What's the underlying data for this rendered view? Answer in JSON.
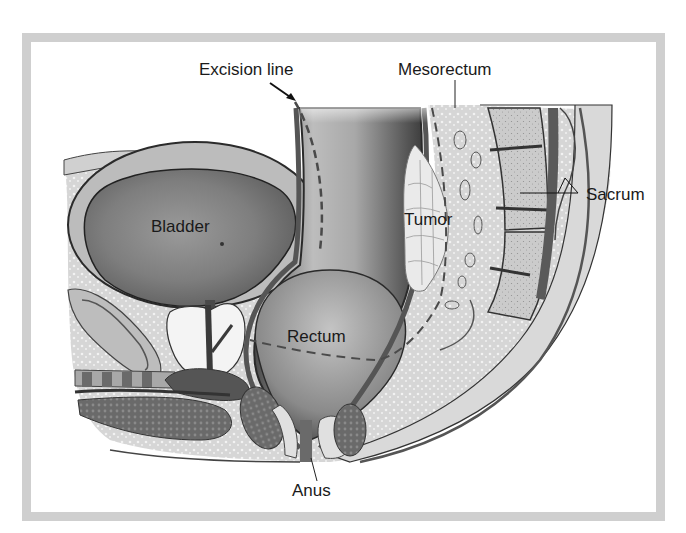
{
  "diagram": {
    "type": "anatomical-cross-section",
    "style": "grayscale medical illustration",
    "frame_color": "#cfcfcf",
    "labels": {
      "excision_line": "Excision line",
      "mesorectum": "Mesorectum",
      "sacrum": "Sacrum",
      "bladder": "Bladder",
      "tumor": "Tumor",
      "rectum": "Rectum",
      "anus": "Anus"
    },
    "structures": [
      {
        "name": "Bladder",
        "pointer": false
      },
      {
        "name": "Rectum",
        "pointer": false
      },
      {
        "name": "Tumor",
        "pointer": false
      },
      {
        "name": "Mesorectum",
        "pointer": "line"
      },
      {
        "name": "Sacrum",
        "pointer": "line"
      },
      {
        "name": "Anus",
        "pointer": "line"
      },
      {
        "name": "Excision line",
        "pointer": "arrow",
        "line_style": "dashed"
      }
    ]
  }
}
